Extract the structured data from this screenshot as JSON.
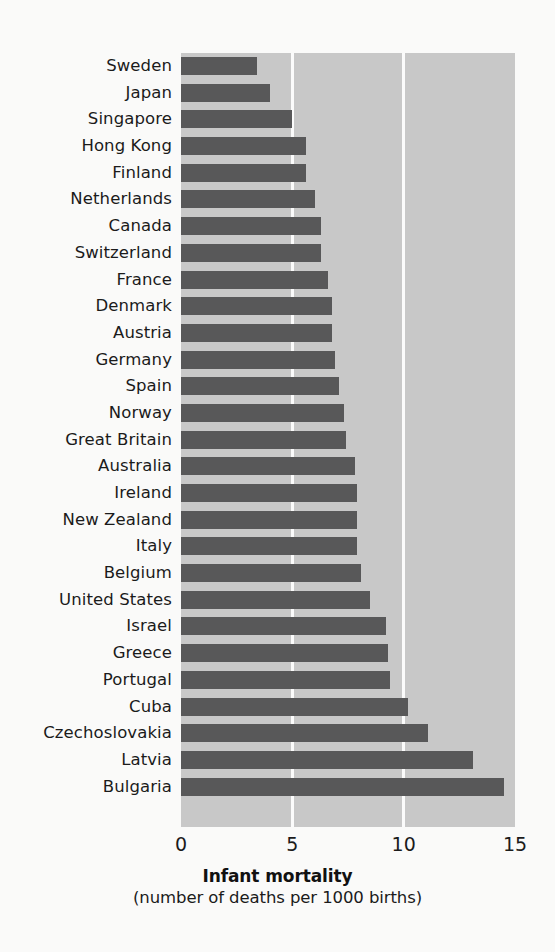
{
  "chart_data": {
    "type": "bar",
    "orientation": "horizontal",
    "title": "Infant mortality",
    "subtitle": "(number of deaths per 1000 births)",
    "xlabel": "Infant mortality",
    "ylabel": "",
    "xlim": [
      0,
      15
    ],
    "xticks": [
      0,
      5,
      10,
      15
    ],
    "xtick_labels": [
      "0",
      "5",
      "10",
      "15"
    ],
    "grid": "vertical-white-gridlines",
    "legend": "none",
    "bar_color": "#585859",
    "plot_background": "#c8c8c8",
    "page_background": "#fafaf9",
    "gridline_color": "#fbfbfb",
    "categories": [
      "Sweden",
      "Japan",
      "Singapore",
      "Hong Kong",
      "Finland",
      "Netherlands",
      "Canada",
      "Switzerland",
      "France",
      "Denmark",
      "Austria",
      "Germany",
      "Spain",
      "Norway",
      "Great Britain",
      "Australia",
      "Ireland",
      "New Zealand",
      "Italy",
      "Belgium",
      "United States",
      "Israel",
      "Greece",
      "Portugal",
      "Cuba",
      "Czechoslovakia",
      "Latvia",
      "Bulgaria"
    ],
    "values": [
      3.4,
      4.0,
      5.0,
      5.6,
      5.6,
      6.0,
      6.3,
      6.3,
      6.6,
      6.8,
      6.8,
      6.9,
      7.1,
      7.3,
      7.4,
      7.8,
      7.9,
      7.9,
      7.9,
      8.1,
      8.5,
      9.2,
      9.3,
      9.4,
      10.2,
      11.1,
      13.1,
      14.5
    ]
  }
}
